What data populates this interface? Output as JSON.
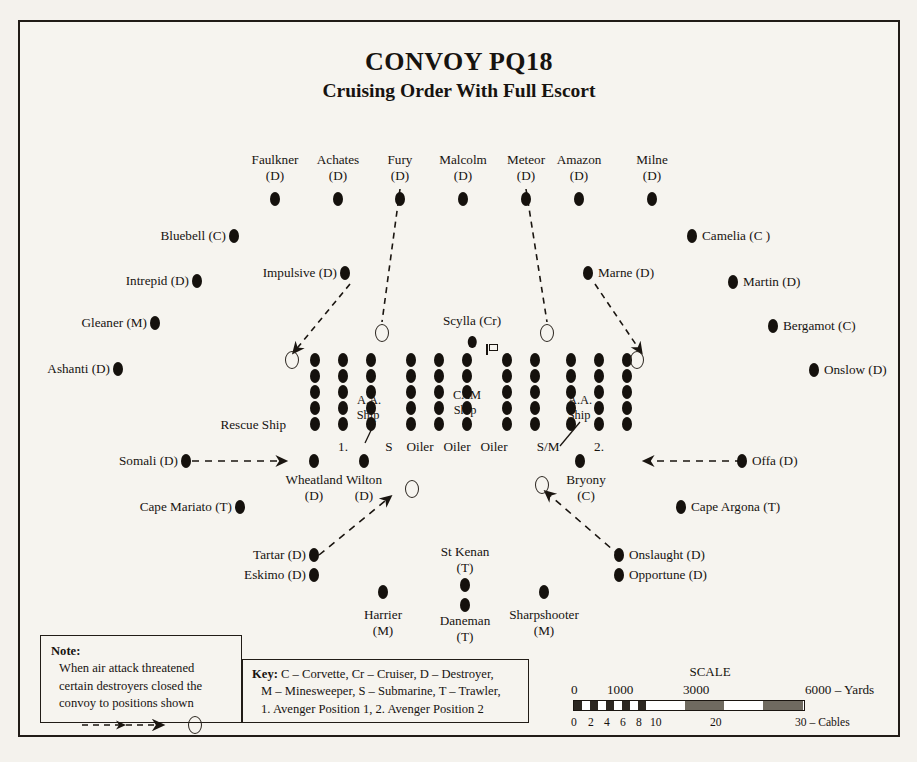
{
  "title": {
    "line1": "CONVOY PQ18",
    "line2": "Cruising Order With Full Escort"
  },
  "screen": {
    "label": "top-screen-destroyers",
    "ships": [
      {
        "name": "Faulkner",
        "type": "(D)",
        "x": 273,
        "y": 176
      },
      {
        "name": "Achates",
        "type": "(D)",
        "x": 336,
        "y": 176
      },
      {
        "name": "Fury",
        "type": "(D)",
        "x": 398,
        "y": 176
      },
      {
        "name": "Malcolm",
        "type": "(D)",
        "x": 461,
        "y": 176
      },
      {
        "name": "Meteor",
        "type": "(D)",
        "x": 524,
        "y": 176
      },
      {
        "name": "Amazon",
        "type": "(D)",
        "x": 577,
        "y": 176
      },
      {
        "name": "Milne",
        "type": "(D)",
        "x": 650,
        "y": 176
      }
    ]
  },
  "flank_left": [
    {
      "label": "Bluebell (C)",
      "x": 230,
      "y": 234
    },
    {
      "label": "Intrepid (D)",
      "x": 193,
      "y": 279
    },
    {
      "label": "Gleaner (M)",
      "x": 151,
      "y": 321
    },
    {
      "label": "Ashanti (D)",
      "x": 114,
      "y": 367
    },
    {
      "label": "Impulsive (D)",
      "x": 341,
      "y": 271
    },
    {
      "label": "Somali (D)",
      "x": 182,
      "y": 459
    },
    {
      "label": "Cape Mariato (T)",
      "x": 236,
      "y": 505
    },
    {
      "label": "Tartar (D)",
      "x": 310,
      "y": 553
    },
    {
      "label": "Eskimo (D)",
      "x": 310,
      "y": 573
    }
  ],
  "flank_right": [
    {
      "label": "Camelia (C )",
      "x": 690,
      "y": 234
    },
    {
      "label": "Martin (D)",
      "x": 731,
      "y": 280
    },
    {
      "label": "Bergamot (C)",
      "x": 771,
      "y": 324
    },
    {
      "label": "Onslow (D)",
      "x": 812,
      "y": 368
    },
    {
      "label": "Marne (D)",
      "x": 586,
      "y": 271
    },
    {
      "label": "Offa (D)",
      "x": 740,
      "y": 459
    },
    {
      "label": "Cape Argona (T)",
      "x": 679,
      "y": 505
    },
    {
      "label": "Onslaught (D)",
      "x": 617,
      "y": 553
    },
    {
      "label": "Opportune (D)",
      "x": 617,
      "y": 573
    }
  ],
  "bottom_ships": [
    {
      "name": "Wheatland",
      "type": "(D)",
      "x": 312,
      "y": 459
    },
    {
      "name": "Wilton",
      "type": "(D)",
      "x": 362,
      "y": 459
    },
    {
      "name": "Bryony",
      "type": "(C)",
      "x": 578,
      "y": 459
    },
    {
      "name": "Harrier",
      "type": "(M)",
      "x": 381,
      "y": 590
    },
    {
      "name": "St Kenan",
      "type": "(T)",
      "x": 463,
      "y": 563,
      "label_above": true
    },
    {
      "name": "Daneman",
      "type": "(T)",
      "x": 463,
      "y": 583
    },
    {
      "name": "Sharpshooter",
      "type": "(M)",
      "x": 542,
      "y": 590
    }
  ],
  "convoy": {
    "columns": [
      {
        "x": 313,
        "bottom_label": ""
      },
      {
        "x": 341,
        "bottom_label": "1."
      },
      {
        "x": 369,
        "bottom_label": ""
      },
      {
        "x": 387,
        "bottom_label": "S"
      },
      {
        "x": 413,
        "bottom_label": "Oiler"
      },
      {
        "x": 441,
        "bottom_label": "Oiler"
      },
      {
        "x": 470,
        "bottom_label": "Oiler"
      },
      {
        "x": 508,
        "bottom_label": ""
      },
      {
        "x": 536,
        "bottom_label": "S/M"
      },
      {
        "x": 564,
        "bottom_label": ""
      },
      {
        "x": 592,
        "bottom_label": "2."
      },
      {
        "x": 620,
        "bottom_label": ""
      }
    ],
    "rows_y": [
      357,
      373,
      389,
      404,
      420
    ],
    "rows": 5,
    "inner_labels": [
      {
        "text": "A.A.",
        "x": 367,
        "y": 394
      },
      {
        "text": "Ship",
        "x": 366,
        "y": 409
      },
      {
        "text": "CAM",
        "x": 465,
        "y": 389
      },
      {
        "text": "Ship",
        "x": 463,
        "y": 404
      },
      {
        "text": "A.A.",
        "x": 578,
        "y": 394
      },
      {
        "text": "Ship",
        "x": 577,
        "y": 409
      }
    ],
    "rescue_ship_label": "Rescue Ship",
    "flagship": {
      "name": "Scylla (Cr)",
      "x": 470,
      "y": 319
    },
    "avenger_positions": [
      {
        "x": 290,
        "y": 357
      },
      {
        "x": 380,
        "y": 330
      },
      {
        "x": 545,
        "y": 330
      },
      {
        "x": 635,
        "y": 357
      },
      {
        "x": 410,
        "y": 486
      },
      {
        "x": 540,
        "y": 482
      },
      {
        "x": 494,
        "y": 459
      },
      {
        "x": 633,
        "y": 459
      }
    ]
  },
  "note": {
    "heading": "Note:",
    "lines": [
      "When air attack threatened",
      "certain destroyers closed the",
      "convoy to positions shown"
    ]
  },
  "key": {
    "heading": "Key:",
    "lines": [
      "C – Corvette, Cr – Cruiser, D – Destroyer,",
      "M – Minesweeper, S – Submarine, T – Trawler,",
      "1. Avenger Position 1, 2. Avenger Position 2"
    ]
  },
  "scale": {
    "title": "SCALE",
    "yards": [
      "0",
      "1000",
      "3000",
      "6000 – Yards"
    ],
    "cables_small": [
      "0",
      "2",
      "4",
      "6",
      "8",
      "10"
    ],
    "cables": [
      "20",
      "30 – Cables"
    ]
  },
  "colors": {
    "ink": "#15110d",
    "paper": "#f6f4ef",
    "border": "#211c17"
  }
}
